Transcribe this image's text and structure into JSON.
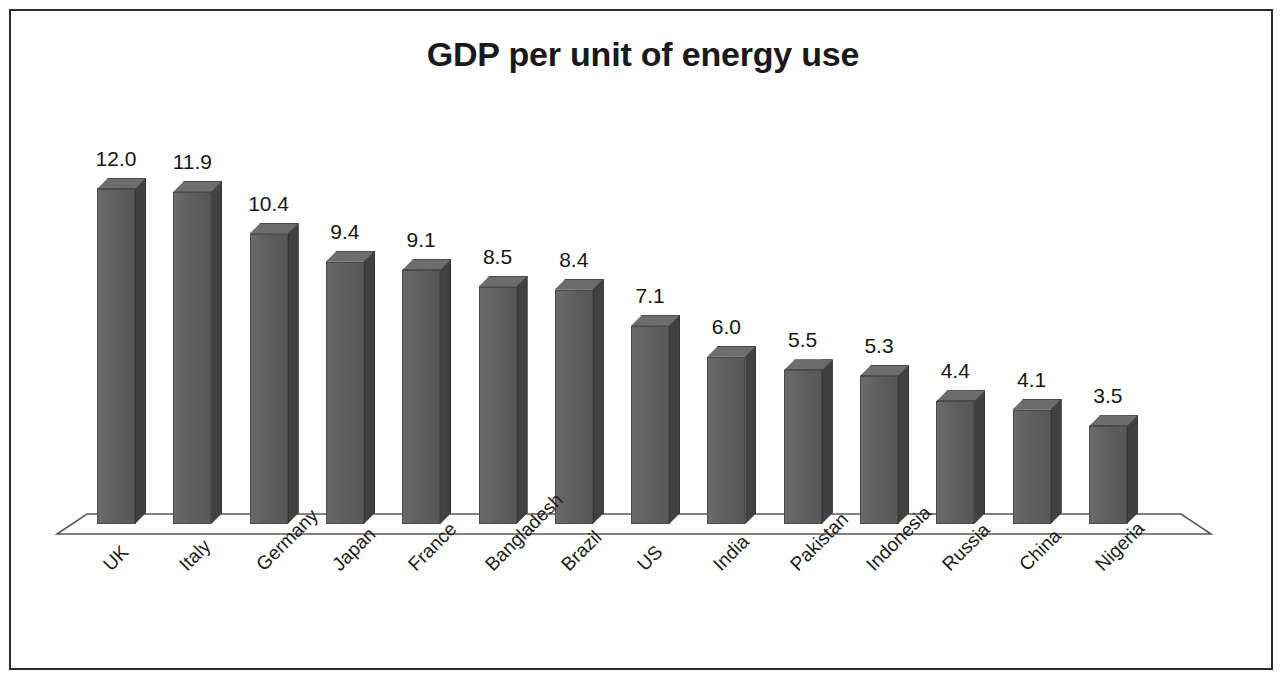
{
  "figure": {
    "title": "GDP per unit of energy use",
    "border_color": "#2b2b2b",
    "background": "#ffffff"
  },
  "chart_data": {
    "type": "bar",
    "title": "GDP per unit of energy use",
    "xlabel": "",
    "ylabel": "",
    "grid": false,
    "legend": "none",
    "three_d": true,
    "ylim": [
      0,
      12.6
    ],
    "categories": [
      "UK",
      "Italy",
      "Germany",
      "Japan",
      "France",
      "Bangladesh",
      "Brazil",
      "US",
      "India",
      "Pakistan",
      "Indonesia",
      "Russia",
      "China",
      "Nigeria"
    ],
    "values": [
      12.0,
      11.9,
      10.4,
      9.4,
      9.1,
      8.5,
      8.4,
      7.1,
      6.0,
      5.5,
      5.3,
      4.4,
      4.1,
      3.5
    ],
    "data_labels": [
      "12.0",
      "11.9",
      "10.4",
      "9.4",
      "9.1",
      "8.5",
      "8.4",
      "7.1",
      "6.0",
      "5.5",
      "5.3",
      "4.4",
      "4.1",
      "3.5"
    ],
    "bar_color": "#5f5f5f",
    "bar_side_color": "#414141",
    "bar_top_color": "#6d6d6d",
    "label_rotation_degrees": -45
  }
}
